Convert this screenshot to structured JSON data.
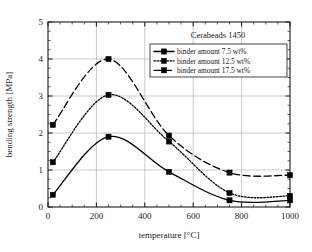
{
  "chart_data": {
    "type": "line",
    "title": "Cerabeads 1450",
    "xlabel": "temperature [°C]",
    "ylabel": "bending strength [MPa]",
    "xlim": [
      0,
      1000
    ],
    "ylim": [
      0,
      5
    ],
    "xticks": [
      0,
      200,
      400,
      600,
      800,
      1000
    ],
    "xticklabels": [
      "0",
      "200",
      "400",
      "600",
      "800",
      "1000"
    ],
    "yticks": [
      0,
      1,
      2,
      3,
      4,
      5
    ],
    "yticklabels": [
      "0",
      "1",
      "2",
      "3",
      "4",
      "5"
    ],
    "x_minor_step": 50,
    "y_minor_step": 0.25,
    "grid": "major-both",
    "legend_position": "top-right",
    "x": [
      20,
      250,
      500,
      750,
      1000
    ],
    "series": [
      {
        "name": "binder amount 7.5 wt%",
        "linestyle": "solid",
        "marker": "square",
        "color": "#000000",
        "values": [
          0.33,
          1.9,
          0.95,
          0.18,
          0.18
        ]
      },
      {
        "name": "binder amount 12.5 wt%",
        "linestyle": "dotted",
        "marker": "square",
        "color": "#000000",
        "values": [
          1.21,
          3.03,
          1.77,
          0.38,
          0.3
        ]
      },
      {
        "name": "binder amount 17.5 wt%",
        "linestyle": "dashed",
        "marker": "square",
        "color": "#000000",
        "values": [
          2.22,
          4.0,
          1.93,
          0.93,
          0.86
        ]
      }
    ]
  }
}
